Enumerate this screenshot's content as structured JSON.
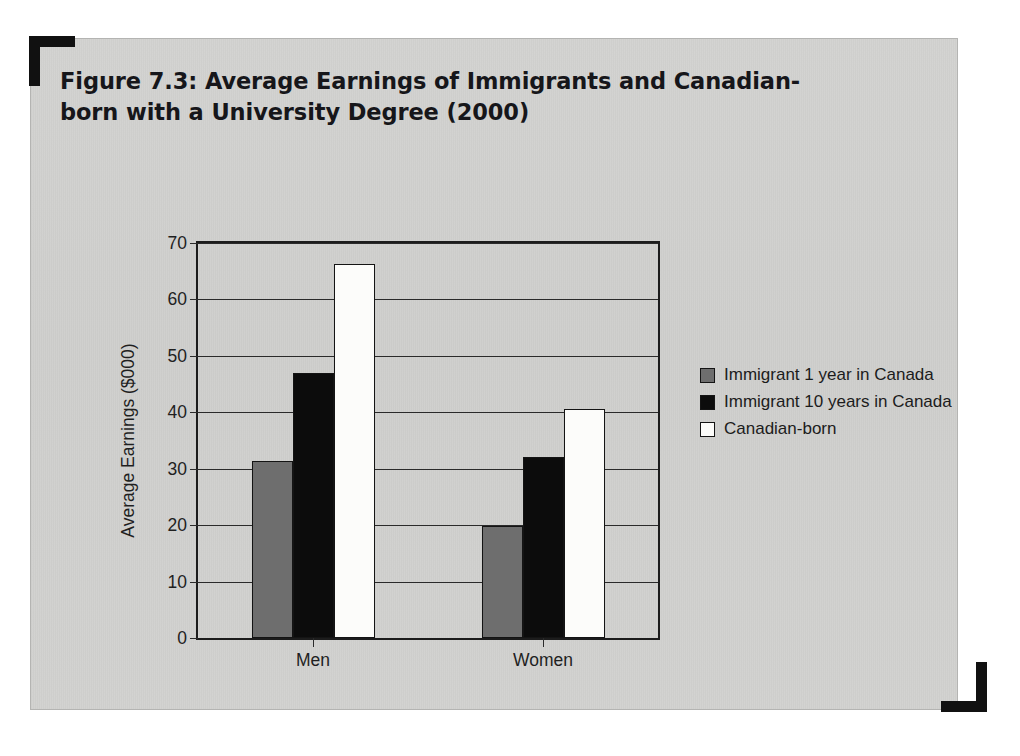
{
  "figure": {
    "title": "Figure 7.3: Average Earnings of Immigrants and Canadian-born with a University Degree (2000)"
  },
  "chart_data": {
    "type": "bar",
    "title": "Figure 7.3: Average Earnings of Immigrants and Canadian-born with a University Degree (2000)",
    "categories": [
      "Men",
      "Women"
    ],
    "series": [
      {
        "name": "Immigrant 1 year in Canada",
        "values": [
          31.3,
          19.8
        ],
        "color": "#6e6e6e"
      },
      {
        "name": "Immigrant 10 years in Canada",
        "values": [
          47.0,
          32.0
        ],
        "color": "#0c0c0c"
      },
      {
        "name": "Canadian-born",
        "values": [
          66.2,
          40.6
        ],
        "color": "#ffffff"
      }
    ],
    "xlabel": "",
    "ylabel": "Average Earnings ($000)",
    "ylim": [
      0,
      70
    ],
    "yticks": [
      0,
      10,
      20,
      30,
      40,
      50,
      60,
      70
    ],
    "ytick_labels": [
      "0",
      "10",
      "20",
      "30",
      "40",
      "50",
      "60",
      "70"
    ],
    "grid": true,
    "legend_position": "right"
  },
  "axes": {
    "y_title": "Average Earnings ($000)"
  },
  "legend": {
    "items": [
      {
        "label": "Immigrant 1 year in Canada"
      },
      {
        "label": "Immigrant 10 years in Canada"
      },
      {
        "label": "Canadian-born"
      }
    ]
  }
}
